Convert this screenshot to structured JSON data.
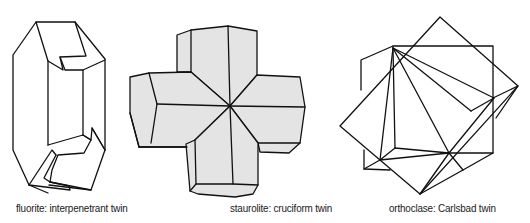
{
  "figures": [
    {
      "id": "fluorite",
      "mineral": "fluorite",
      "caption": "fluorite: interpenetrant twin"
    },
    {
      "id": "staurolite",
      "mineral": "staurolite",
      "caption": "staurolite: cruciform twin"
    },
    {
      "id": "orthoclase",
      "mineral": "orthoclase",
      "caption": "orthoclase: Carlsbad twin"
    }
  ],
  "colors": {
    "line": "#111111",
    "staurolite_fill": "#e4e4e4",
    "background": "#ffffff"
  }
}
